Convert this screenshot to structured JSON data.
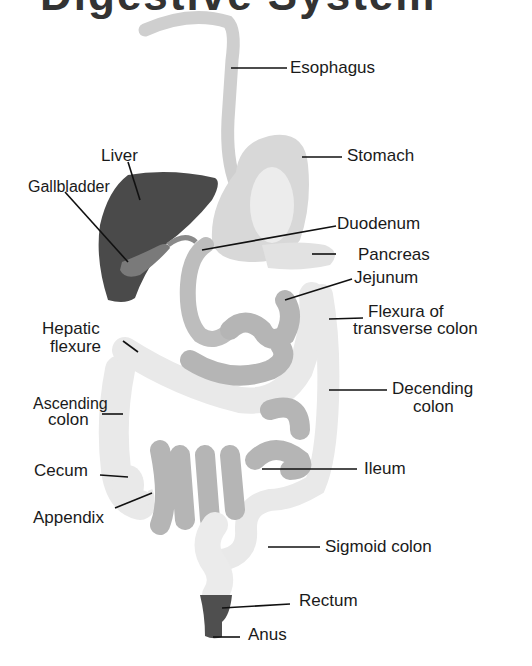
{
  "title_fragment": "Digestive System",
  "colors": {
    "liver": "#4a4a4a",
    "gallbladder": "#7a7a7a",
    "esophagus": "#cfcfcf",
    "stomach_outer": "#d8d8d8",
    "stomach_inner": "#ececec",
    "duodenum": "#bdbdbd",
    "pancreas": "#e2e2e2",
    "small_intestine": "#b5b5b5",
    "colon": "#e9e9e9",
    "rectum": "#4f4f4f",
    "leader_line": "#111111"
  },
  "labels": {
    "esophagus": "Esophagus",
    "stomach": "Stomach",
    "liver": "Liver",
    "gallbladder": "Gallbladder",
    "duodenum": "Duodenum",
    "pancreas": "Pancreas",
    "jejunum": "Jejunum",
    "flexura_line1": "Flexura of",
    "flexura_line2": "transverse colon",
    "hepatic_line1": "Hepatic",
    "hepatic_line2": "flexure",
    "descending_line1": "Decending",
    "descending_line2": "colon",
    "ascending_line1": "Ascending",
    "ascending_line2": "colon",
    "cecum": "Cecum",
    "ileum": "Ileum",
    "appendix": "Appendix",
    "sigmoid": "Sigmoid colon",
    "rectum": "Rectum",
    "anus": "Anus"
  }
}
